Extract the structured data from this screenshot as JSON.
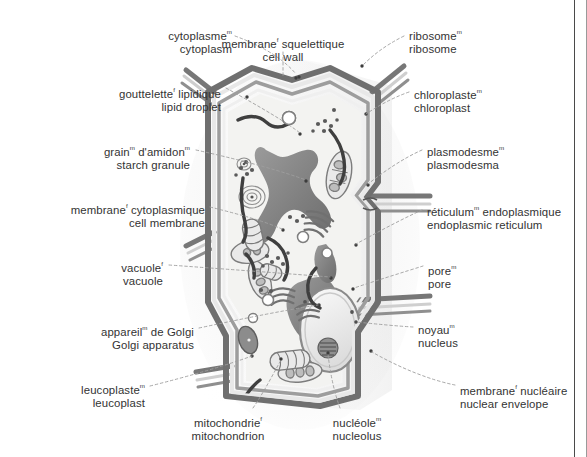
{
  "diagram": {
    "languages": [
      "French",
      "English"
    ],
    "gender_markers": {
      "masculine": "m",
      "feminine": "f"
    },
    "colors": {
      "text": "#333333",
      "leader_line": "#9a9a9a",
      "frame_line": "#4a4a4a",
      "wall_dark": "#6e6e6e",
      "wall_mid": "#9e9e9e",
      "wall_light": "#d8d8d8",
      "cytosol": "#f2f2f0",
      "organelle_dark": "#7c7c7c",
      "vacuole": "#8a8a8a",
      "background": "#ffffff"
    }
  },
  "labels": [
    {
      "id": "cytoplasm",
      "fr": "cytoplasme",
      "fr_gender": "m",
      "fr_tail": "",
      "en": "cytoplasm",
      "align": "right",
      "x": 230,
      "y": 26
    },
    {
      "id": "cell-wall",
      "fr": "membrane",
      "fr_gender": "f",
      "fr_tail": " squelettique",
      "en": "cell wall",
      "align": "center",
      "x": 283,
      "y": 34
    },
    {
      "id": "ribosome",
      "fr": "ribosome",
      "fr_gender": "m",
      "fr_tail": "",
      "en": "ribosome",
      "align": "left",
      "x": 409,
      "y": 26
    },
    {
      "id": "lipid-droplet",
      "fr": "gouttelette",
      "fr_gender": "f",
      "fr_tail": " lipidique",
      "en": "lipid droplet",
      "align": "right",
      "x": 221,
      "y": 84
    },
    {
      "id": "chloroplast",
      "fr": "chloroplaste",
      "fr_gender": "m",
      "fr_tail": "",
      "en": "chloroplast",
      "align": "left",
      "x": 414,
      "y": 85
    },
    {
      "id": "starch-granule",
      "fr": "grain",
      "fr_gender": "m",
      "fr_tail": " d'amidon",
      "en": "starch granule",
      "align": "right",
      "x": 190,
      "y": 142,
      "fr_tail_gender": "m"
    },
    {
      "id": "plasmodesma",
      "fr": "plasmodesme",
      "fr_gender": "m",
      "fr_tail": "",
      "en": "plasmodesma",
      "align": "left",
      "x": 427,
      "y": 142
    },
    {
      "id": "cell-membrane",
      "fr": "membrane",
      "fr_gender": "f",
      "fr_tail": " cytoplasmique",
      "en": "cell membrane",
      "align": "right",
      "x": 205,
      "y": 200
    },
    {
      "id": "endoplasmic-reticulum",
      "fr": "réticulum",
      "fr_gender": "m",
      "fr_tail": " endoplasmique",
      "en": "endoplasmic reticulum",
      "align": "left",
      "x": 427,
      "y": 202
    },
    {
      "id": "vacuole",
      "fr": "vacuole",
      "fr_gender": "f",
      "fr_tail": "",
      "en": "vacuole",
      "align": "right",
      "x": 163,
      "y": 258
    },
    {
      "id": "pore",
      "fr": "pore",
      "fr_gender": "m",
      "fr_tail": "",
      "en": "pore",
      "align": "left",
      "x": 428,
      "y": 261
    },
    {
      "id": "golgi-apparatus",
      "fr": "appareil",
      "fr_gender": "m",
      "fr_tail": " de Golgi",
      "en": "Golgi apparatus",
      "align": "right",
      "x": 194,
      "y": 322
    },
    {
      "id": "nucleus",
      "fr": "noyau",
      "fr_gender": "m",
      "fr_tail": "",
      "en": "nucleus",
      "align": "left",
      "x": 418,
      "y": 320
    },
    {
      "id": "leucoplast",
      "fr": "leucoplaste",
      "fr_gender": "m",
      "fr_tail": "",
      "en": "leucoplast",
      "align": "right",
      "x": 145,
      "y": 380
    },
    {
      "id": "nuclear-envelope",
      "fr": "membrane",
      "fr_gender": "f",
      "fr_tail": " nucléaire",
      "en": "nuclear envelope",
      "align": "left",
      "x": 460,
      "y": 381
    },
    {
      "id": "mitochondrion",
      "fr": "mitochondrie",
      "fr_gender": "f",
      "fr_tail": "",
      "en": "mitochondrion",
      "align": "center",
      "x": 228,
      "y": 413
    },
    {
      "id": "nucleolus",
      "fr": "nucléole",
      "fr_gender": "m",
      "fr_tail": "",
      "en": "nucleolus",
      "align": "center",
      "x": 357,
      "y": 413
    }
  ],
  "leaders": [
    {
      "id": "cytoplasm-leader",
      "d": "M235,36 C268,48 286,62 296,74"
    },
    {
      "id": "cell-wall-leader",
      "d": "M283,50 L283,78"
    },
    {
      "id": "ribosome-leader",
      "d": "M404,36 C384,46 372,56 362,66"
    },
    {
      "id": "lipid-droplet-leader",
      "d": "M226,88 C262,108 286,122 300,133"
    },
    {
      "id": "chloroplast-leader",
      "d": "M409,92 C392,98 378,106 366,114"
    },
    {
      "id": "starch-granule-leader",
      "d": "M196,150 C250,162 284,172 306,180"
    },
    {
      "id": "plasmodesma-leader",
      "d": "M422,150 C404,158 386,170 368,184"
    },
    {
      "id": "cell-membrane-leader",
      "d": "M210,207 C246,216 266,222 282,229"
    },
    {
      "id": "endoplasmic-reticulum-leader",
      "d": "M422,210 C400,220 378,232 356,244"
    },
    {
      "id": "vacuole-leader",
      "d": "M169,265 C238,270 292,274 330,277"
    },
    {
      "id": "pore-leader",
      "d": "M423,266 C404,272 378,280 354,288"
    },
    {
      "id": "golgi-apparatus-leader",
      "d": "M199,328 C246,318 286,310 318,305"
    },
    {
      "id": "nucleus-leader",
      "d": "M413,327 C396,326 376,324 356,322"
    },
    {
      "id": "leucoplast-leader",
      "d": "M150,386 C190,376 224,366 252,356"
    },
    {
      "id": "nuclear-envelope-leader",
      "d": "M455,385 C430,380 400,368 372,352"
    },
    {
      "id": "mitochondrion-leader",
      "d": "M253,408 C264,392 272,376 280,360"
    },
    {
      "id": "nucleolus-leader",
      "d": "M340,408 C334,392 330,372 328,354"
    }
  ]
}
